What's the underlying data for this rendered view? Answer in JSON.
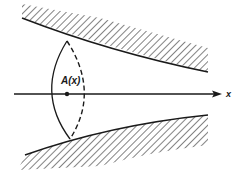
{
  "diagram": {
    "labels": {
      "area": "A(x)",
      "axis": "x"
    },
    "colors": {
      "ink": "#1a1a1a",
      "background": "#ffffff"
    },
    "elements": [
      "upper hatched wall",
      "lower hatched wall",
      "cross-section ellipse (solid front, dashed back)",
      "x axis arrow",
      "center point"
    ]
  }
}
